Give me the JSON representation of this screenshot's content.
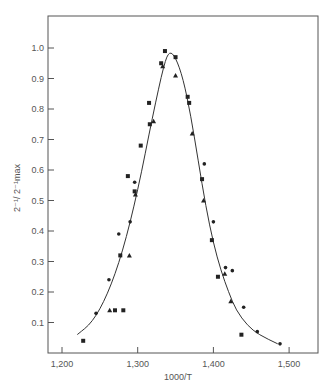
{
  "chart_data": {
    "type": "scatter",
    "title": "",
    "xlabel": "1000/T",
    "ylabel": "2⁻¹/ 2⁻¹max",
    "xlim": [
      1.175,
      1.54
    ],
    "ylim": [
      0.0,
      1.1
    ],
    "x_ticks": [
      "1.200",
      "1.300",
      "1.400",
      "1.500"
    ],
    "y_ticks": [
      "0.1",
      "0.2",
      "0.3",
      "0.4",
      "0.5",
      "0.6",
      "0.7",
      "0.8",
      "0.9",
      "1.0"
    ],
    "grid": false,
    "legend": null,
    "series": [
      {
        "name": "squares",
        "marker": "square",
        "points": [
          [
            1.228,
            0.04
          ],
          [
            1.27,
            0.14
          ],
          [
            1.281,
            0.14
          ],
          [
            1.277,
            0.32
          ],
          [
            1.287,
            0.58
          ],
          [
            1.296,
            0.53
          ],
          [
            1.304,
            0.68
          ],
          [
            1.315,
            0.82
          ],
          [
            1.316,
            0.75
          ],
          [
            1.331,
            0.95
          ],
          [
            1.336,
            0.99
          ],
          [
            1.35,
            0.97
          ],
          [
            1.366,
            0.84
          ],
          [
            1.368,
            0.82
          ],
          [
            1.385,
            0.57
          ],
          [
            1.398,
            0.37
          ],
          [
            1.406,
            0.25
          ],
          [
            1.437,
            0.06
          ]
        ]
      },
      {
        "name": "circles",
        "marker": "circle",
        "points": [
          [
            1.245,
            0.13
          ],
          [
            1.262,
            0.24
          ],
          [
            1.275,
            0.39
          ],
          [
            1.29,
            0.43
          ],
          [
            1.296,
            0.56
          ],
          [
            1.388,
            0.62
          ],
          [
            1.4,
            0.43
          ],
          [
            1.416,
            0.28
          ],
          [
            1.425,
            0.27
          ],
          [
            1.44,
            0.15
          ],
          [
            1.458,
            0.07
          ],
          [
            1.488,
            0.03
          ]
        ]
      },
      {
        "name": "triangles",
        "marker": "triangle",
        "points": [
          [
            1.263,
            0.14
          ],
          [
            1.289,
            0.32
          ],
          [
            1.297,
            0.52
          ],
          [
            1.321,
            0.76
          ],
          [
            1.333,
            0.94
          ],
          [
            1.35,
            0.91
          ],
          [
            1.372,
            0.72
          ],
          [
            1.387,
            0.5
          ],
          [
            1.415,
            0.26
          ],
          [
            1.423,
            0.17
          ]
        ]
      },
      {
        "name": "fitted-curve",
        "marker": "line",
        "points": [
          [
            1.22,
            0.06
          ],
          [
            1.24,
            0.1
          ],
          [
            1.26,
            0.19
          ],
          [
            1.28,
            0.33
          ],
          [
            1.3,
            0.53
          ],
          [
            1.32,
            0.78
          ],
          [
            1.335,
            0.95
          ],
          [
            1.342,
            0.99
          ],
          [
            1.35,
            0.97
          ],
          [
            1.36,
            0.9
          ],
          [
            1.37,
            0.78
          ],
          [
            1.38,
            0.63
          ],
          [
            1.39,
            0.48
          ],
          [
            1.4,
            0.36
          ],
          [
            1.41,
            0.27
          ],
          [
            1.42,
            0.2
          ],
          [
            1.43,
            0.14
          ],
          [
            1.445,
            0.09
          ],
          [
            1.46,
            0.06
          ],
          [
            1.485,
            0.03
          ]
        ]
      }
    ]
  }
}
